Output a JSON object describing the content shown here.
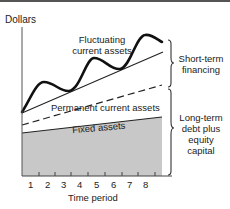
{
  "figure": {
    "y_axis_label": "Dollars",
    "x_axis_label": "Time period",
    "x_ticks": [
      "1",
      "2",
      "3",
      "4",
      "5",
      "6",
      "7",
      "8"
    ],
    "regions": {
      "fluctuating": [
        "Fluctuating",
        "current assets"
      ],
      "permanent": "Permanent current assets",
      "fixed": "Fixed assets"
    },
    "braces": {
      "short_term": [
        "Short-term",
        "financing"
      ],
      "long_term": [
        "Long-term",
        "debt plus",
        "equity",
        "capital"
      ]
    },
    "colors": {
      "fixed_fill": "#c8c8c8",
      "line": "#111111"
    }
  }
}
